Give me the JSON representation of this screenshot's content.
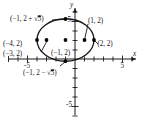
{
  "figure": {
    "type": "ellipse-graph",
    "axes": {
      "x_label": "x",
      "y_label": "y",
      "x_ticks": [
        {
          "value": -5,
          "label": "-5"
        },
        {
          "value": 5,
          "label": "5"
        }
      ],
      "y_ticks": [
        {
          "value": 5,
          "label": "5"
        },
        {
          "value": -5,
          "label": "-5"
        }
      ],
      "x_range": [
        -7,
        7
      ],
      "y_range": [
        -7,
        7
      ],
      "tick_step": 1,
      "grid": false
    },
    "curve": {
      "kind": "ellipse",
      "center": [
        -1,
        2
      ],
      "semi_major_x": 3,
      "semi_minor_y": 2.2360679,
      "stroke": "#1a1a1a"
    },
    "points": [
      {
        "id": "co-vertex-top",
        "x": -1,
        "y": 4.2360679,
        "label": "(-1, 2 + √5)"
      },
      {
        "id": "vertex-left",
        "x": -4,
        "y": 2,
        "label": "(-4, 2)"
      },
      {
        "id": "focus-left",
        "x": -3,
        "y": 2,
        "label": "(-3, 2)"
      },
      {
        "id": "center",
        "x": -1,
        "y": 2,
        "label": "(-1, 2)"
      },
      {
        "id": "focus-right",
        "x": 1,
        "y": 2,
        "label": "(1, 2)"
      },
      {
        "id": "vertex-right",
        "x": 2,
        "y": 2,
        "label": "(2, 2)"
      },
      {
        "id": "co-vertex-bottom",
        "x": -1,
        "y": -0.236068,
        "label": "(-1, 2 - √5)"
      }
    ],
    "labels": {
      "top_covertex": {
        "prefix": "(−1, 2 + ",
        "radical": "5",
        "suffix": ")"
      },
      "bottom_covertex": {
        "prefix": "(−1, 2 − ",
        "radical": "5",
        "suffix": ")"
      },
      "left_vertex": "(−4, 2)",
      "left_focus": "(−3, 2)",
      "center": "(−1, 2)",
      "right_focus": "(1, 2)",
      "right_vertex": "(2, 2)"
    },
    "colors": {
      "stroke": "#1a1a1a",
      "point_fill": "#000000",
      "background": "#ffffff"
    }
  }
}
